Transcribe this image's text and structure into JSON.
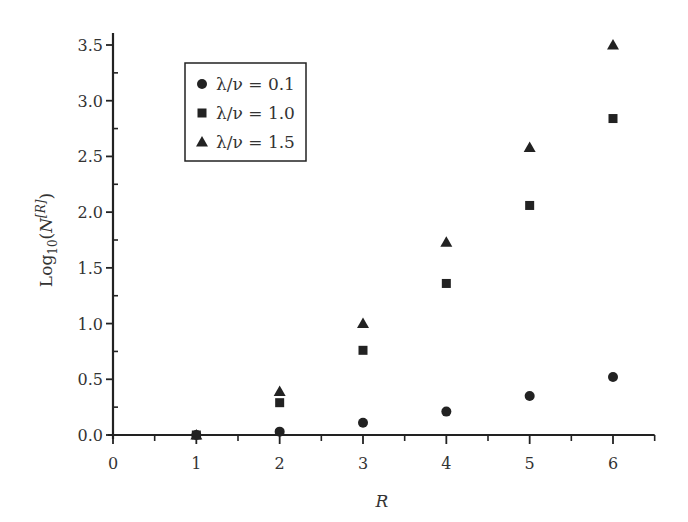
{
  "chart_data": {
    "type": "scatter",
    "title": "",
    "xlabel": "R",
    "ylabel": "Log10(N[R])",
    "ylabel_parts": {
      "base": "Log",
      "sub": "10",
      "open": "(N",
      "sup": "[R]",
      "close": ")"
    },
    "xlim": [
      0,
      6.5
    ],
    "ylim": [
      0,
      3.5
    ],
    "xticks": [
      0,
      1,
      2,
      3,
      4,
      5,
      6
    ],
    "xtick_labels": [
      "0",
      "1",
      "2",
      "3",
      "4",
      "5",
      "6"
    ],
    "yticks": [
      0.0,
      0.5,
      1.0,
      1.5,
      2.0,
      2.5,
      3.0,
      3.5
    ],
    "ytick_labels": [
      "0.0",
      "0.5",
      "1.0",
      "1.5",
      "2.0",
      "2.5",
      "3.0",
      "3.5"
    ],
    "grid": false,
    "legend_position": "upper left",
    "x": [
      1,
      2,
      3,
      4,
      5,
      6
    ],
    "series": [
      {
        "name": "λ/ν = 0.1",
        "marker": "circle",
        "values": [
          0.0,
          0.03,
          0.11,
          0.21,
          0.35,
          0.52
        ]
      },
      {
        "name": "λ/ν = 1.0",
        "marker": "square",
        "values": [
          0.0,
          0.29,
          0.76,
          1.36,
          2.06,
          2.84
        ]
      },
      {
        "name": "λ/ν = 1.5",
        "marker": "triangle",
        "values": [
          0.0,
          0.39,
          1.0,
          1.73,
          2.58,
          3.5
        ]
      }
    ]
  },
  "colors": {
    "ink": "#222222",
    "text": "#333333"
  }
}
